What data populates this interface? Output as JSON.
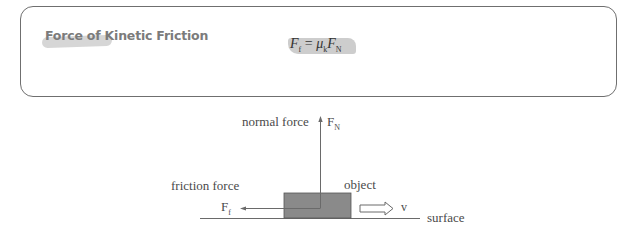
{
  "panel": {
    "title": "Force of Kinetic Friction",
    "formula": {
      "lhs_symbol": "F",
      "lhs_subscript": "f",
      "equals": "=",
      "coef_symbol": "μ",
      "coef_subscript": "k",
      "rhs_symbol": "F",
      "rhs_subscript": "N"
    }
  },
  "diagram": {
    "normal_force_label": "normal force",
    "normal_force_symbol": "F",
    "normal_force_subscript": "N",
    "friction_force_label": "friction force",
    "friction_force_symbol": "F",
    "friction_force_subscript": "f",
    "object_label": "object",
    "velocity_label": "v",
    "surface_label": "surface",
    "colors": {
      "object_fill": "#8a8a8a",
      "line": "#6a6a6a"
    }
  }
}
